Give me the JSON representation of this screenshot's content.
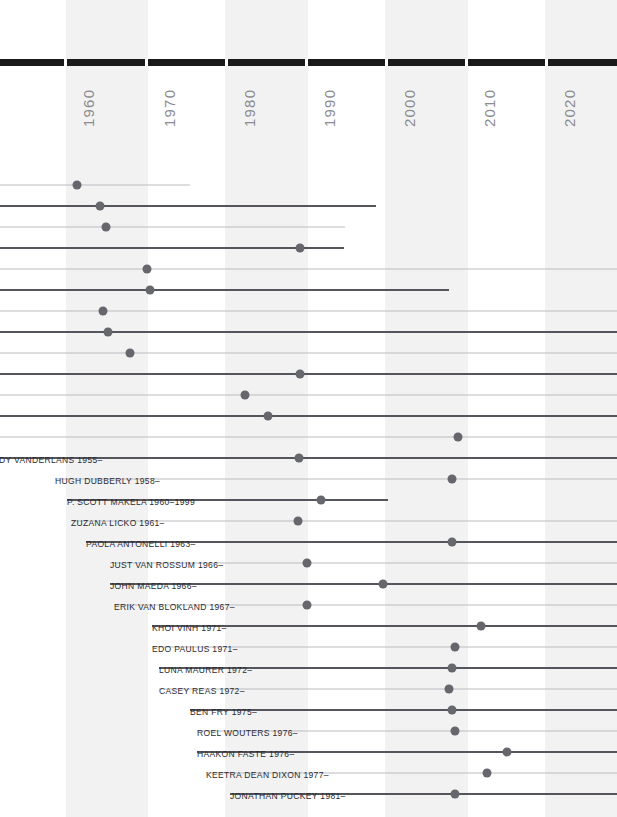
{
  "chart_data": {
    "type": "line",
    "title": "",
    "xlabel": "",
    "ylabel": "",
    "xlim": [
      1955,
      2025
    ],
    "grid": false,
    "legend": "none",
    "axis": {
      "tick_labels": [
        "1960",
        "1970",
        "1980",
        "1990",
        "2000",
        "2010",
        "2020"
      ],
      "tick_values": [
        1960,
        1970,
        1980,
        1990,
        2000,
        2010,
        2020
      ],
      "tick_x_px": [
        64,
        145,
        225,
        305,
        385,
        465,
        545
      ],
      "orientation": "vertical-rotated",
      "color": "#8b8b90",
      "bar_color": "#1a1a1a"
    },
    "bands": [
      {
        "x": 66,
        "width": 82
      },
      {
        "x": 225,
        "width": 83
      },
      {
        "x": 385,
        "width": 83
      },
      {
        "x": 545,
        "width": 72
      }
    ],
    "colors": {
      "band": "#f2f2f3",
      "line_thick": "#55555c",
      "line_thin": "#bcbcc2",
      "dot": "#66666d",
      "label": "#2b2b30"
    },
    "series": [
      {
        "name": "",
        "label": "",
        "label_x": 0,
        "row_y": 184,
        "line_start": 0,
        "line_end": 190,
        "dot_x": 77,
        "weight": "thin"
      },
      {
        "name": "",
        "label": "",
        "label_x": 0,
        "row_y": 205,
        "line_start": 0,
        "line_end": 376,
        "dot_x": 100,
        "weight": "thick"
      },
      {
        "name": "",
        "label": "",
        "label_x": 0,
        "row_y": 226,
        "line_start": 0,
        "line_end": 345,
        "dot_x": 106,
        "weight": "thin"
      },
      {
        "name": "",
        "label": "",
        "label_x": 0,
        "row_y": 247,
        "line_start": 0,
        "line_end": 344,
        "dot_x": 300,
        "weight": "thick"
      },
      {
        "name": "",
        "label": "",
        "label_x": 0,
        "row_y": 268,
        "line_start": 0,
        "line_end": 617,
        "dot_x": 147,
        "weight": "thin"
      },
      {
        "name": "",
        "label": "",
        "label_x": 0,
        "row_y": 289,
        "line_start": 0,
        "line_end": 449,
        "dot_x": 150,
        "weight": "thick"
      },
      {
        "name": "",
        "label": "",
        "label_x": 0,
        "row_y": 310,
        "line_start": 0,
        "line_end": 617,
        "dot_x": 103,
        "weight": "thin"
      },
      {
        "name": "",
        "label": "",
        "label_x": 0,
        "row_y": 331,
        "line_start": 0,
        "line_end": 617,
        "dot_x": 108,
        "weight": "thick"
      },
      {
        "name": "",
        "label": "",
        "label_x": 0,
        "row_y": 352,
        "line_start": 0,
        "line_end": 617,
        "dot_x": 130,
        "weight": "thin"
      },
      {
        "name": "",
        "label": "",
        "label_x": 0,
        "row_y": 373,
        "line_start": 0,
        "line_end": 617,
        "dot_x": 300,
        "weight": "thick"
      },
      {
        "name": "",
        "label": "",
        "label_x": 0,
        "row_y": 394,
        "line_start": 0,
        "line_end": 617,
        "dot_x": 245,
        "weight": "thin"
      },
      {
        "name": "",
        "label": "",
        "label_x": 0,
        "row_y": 415,
        "line_start": 0,
        "line_end": 617,
        "dot_x": 268,
        "weight": "thick"
      },
      {
        "name": "",
        "label": "",
        "label_x": 0,
        "row_y": 436,
        "line_start": 0,
        "line_end": 617,
        "dot_x": 458,
        "weight": "thin"
      },
      {
        "name": "Rudy VanderLans",
        "label": "RUDY VANDERLANS 1955–",
        "label_x": -14,
        "row_y": 457,
        "line_start": 0,
        "line_end": 617,
        "dot_x": 299,
        "weight": "thick"
      },
      {
        "name": "Hugh Dubberly",
        "label": "HUGH DUBBERLY 1958–",
        "label_x": 55,
        "row_y": 478,
        "line_start": 55,
        "line_end": 617,
        "dot_x": 452,
        "weight": "thin"
      },
      {
        "name": "P. Scott Makela",
        "label": "P. SCOTT MAKELA 1960–1999",
        "label_x": 67,
        "row_y": 499,
        "line_start": 67,
        "line_end": 388,
        "dot_x": 321,
        "weight": "thick"
      },
      {
        "name": "Zuzana Licko",
        "label": "ZUZANA LICKO 1961–",
        "label_x": 71,
        "row_y": 520,
        "line_start": 71,
        "line_end": 617,
        "dot_x": 298,
        "weight": "thin"
      },
      {
        "name": "Paola Antonelli",
        "label": "PAOLA ANTONELLI 1963–",
        "label_x": 86,
        "row_y": 541,
        "line_start": 86,
        "line_end": 617,
        "dot_x": 452,
        "weight": "thick"
      },
      {
        "name": "Just van Rossum",
        "label": "JUST VAN ROSSUM 1966–",
        "label_x": 110,
        "row_y": 562,
        "line_start": 110,
        "line_end": 617,
        "dot_x": 307,
        "weight": "thin"
      },
      {
        "name": "John Maeda",
        "label": "JOHN MAEDA 1966–",
        "label_x": 110,
        "row_y": 583,
        "line_start": 110,
        "line_end": 617,
        "dot_x": 383,
        "weight": "thick"
      },
      {
        "name": "Erik van Blokland",
        "label": "ERIK VAN BLOKLAND 1967–",
        "label_x": 114,
        "row_y": 604,
        "line_start": 114,
        "line_end": 617,
        "dot_x": 307,
        "weight": "thin"
      },
      {
        "name": "Khoi Vinh",
        "label": "KHOI VINH 1971–",
        "label_x": 152,
        "row_y": 625,
        "line_start": 152,
        "line_end": 617,
        "dot_x": 481,
        "weight": "thick"
      },
      {
        "name": "Edo Paulus",
        "label": "EDO PAULUS 1971–",
        "label_x": 152,
        "row_y": 646,
        "line_start": 152,
        "line_end": 617,
        "dot_x": 455,
        "weight": "thin"
      },
      {
        "name": "Luna Maurer",
        "label": "LUNA MAURER 1972–",
        "label_x": 159,
        "row_y": 667,
        "line_start": 159,
        "line_end": 617,
        "dot_x": 452,
        "weight": "thick"
      },
      {
        "name": "Casey Reas",
        "label": "CASEY REAS 1972–",
        "label_x": 159,
        "row_y": 688,
        "line_start": 159,
        "line_end": 617,
        "dot_x": 449,
        "weight": "thin"
      },
      {
        "name": "Ben Fry",
        "label": "BEN FRY 1975–",
        "label_x": 190,
        "row_y": 709,
        "line_start": 190,
        "line_end": 617,
        "dot_x": 452,
        "weight": "thick"
      },
      {
        "name": "Roel Wouters",
        "label": "ROEL WOUTERS 1976–",
        "label_x": 197,
        "row_y": 730,
        "line_start": 197,
        "line_end": 617,
        "dot_x": 455,
        "weight": "thin"
      },
      {
        "name": "Haakon Faste",
        "label": "HAAKON FASTE 1976–",
        "label_x": 197,
        "row_y": 751,
        "line_start": 197,
        "line_end": 617,
        "dot_x": 507,
        "weight": "thick"
      },
      {
        "name": "Keetra Dean Dixon",
        "label": "KEETRA DEAN DIXON 1977–",
        "label_x": 206,
        "row_y": 772,
        "line_start": 206,
        "line_end": 617,
        "dot_x": 487,
        "weight": "thin"
      },
      {
        "name": "Jonathan Puckey",
        "label": "JONATHAN PUCKEY 1981–",
        "label_x": 230,
        "row_y": 793,
        "line_start": 230,
        "line_end": 617,
        "dot_x": 455,
        "weight": "thick"
      }
    ]
  }
}
